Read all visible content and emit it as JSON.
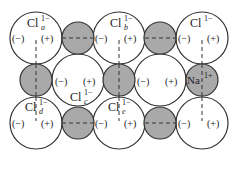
{
  "colors": {
    "large_fill": "#ffffff",
    "small_fill": "#a9a9a9",
    "stroke": "#333333"
  },
  "large_ions": [
    {
      "id": "cl-a",
      "label": "Cl",
      "sup": "1−",
      "sub": "a",
      "cx": 36,
      "cy": 38,
      "r": 26,
      "charges": "(−)-(+)",
      "label_pos": "top"
    },
    {
      "id": "cl-b",
      "label": "Cl",
      "sup": "1−",
      "sub": "b",
      "cx": 119,
      "cy": 38,
      "r": 26,
      "charges": "(−)-(+)",
      "label_pos": "top"
    },
    {
      "id": "cl-top-right",
      "label": "Cl",
      "sup": "1−",
      "sub": "",
      "cx": 202,
      "cy": 38,
      "r": 26,
      "charges": "(−)-(+)",
      "label_pos": "top"
    },
    {
      "id": "cl-c",
      "label": "Cl",
      "sup": "1−",
      "sub": "c",
      "cx": 78,
      "cy": 80,
      "r": 26,
      "charges": "(−) (+)",
      "label_pos": "bottom"
    },
    {
      "id": "cl-mid-right",
      "label": "",
      "sup": "",
      "sub": "",
      "cx": 160,
      "cy": 80,
      "r": 26,
      "charges": "(−) (+)",
      "label_pos": "none"
    },
    {
      "id": "cl-d",
      "label": "Cl",
      "sup": "1−",
      "sub": "d",
      "cx": 36,
      "cy": 123,
      "r": 26,
      "charges": "(−)-(+)",
      "label_pos": "top"
    },
    {
      "id": "cl-e",
      "label": "Cl",
      "sup": "1−",
      "sub": "e",
      "cx": 119,
      "cy": 123,
      "r": 26,
      "charges": "(−)-(+)",
      "label_pos": "top"
    },
    {
      "id": "cl-bottom-right",
      "label": "",
      "sup": "",
      "sub": "",
      "cx": 202,
      "cy": 123,
      "r": 26,
      "charges": "(−)-(+)",
      "label_pos": "none"
    }
  ],
  "small_ions": [
    {
      "id": "na-top-1",
      "cx": 78,
      "cy": 38,
      "r": 16,
      "label": ""
    },
    {
      "id": "na-top-2",
      "cx": 160,
      "cy": 38,
      "r": 16,
      "label": ""
    },
    {
      "id": "na-mid-1",
      "cx": 36,
      "cy": 80,
      "r": 16,
      "label": ""
    },
    {
      "id": "na-mid-2",
      "cx": 119,
      "cy": 80,
      "r": 16,
      "label": ""
    },
    {
      "id": "na-mid-3",
      "cx": 202,
      "cy": 80,
      "r": 16,
      "label": "Na",
      "sup": "1+"
    },
    {
      "id": "na-bot-1",
      "cx": 78,
      "cy": 123,
      "r": 16,
      "label": ""
    },
    {
      "id": "na-bot-2",
      "cx": 160,
      "cy": 123,
      "r": 16,
      "label": ""
    }
  ],
  "text": {
    "neg": "(−)",
    "pos": "(+)",
    "cl": "Cl",
    "cl_charge": "1−",
    "na": "Na",
    "na_charge": "1+",
    "sub_a": "a",
    "sub_b": "b",
    "sub_c": "c",
    "sub_d": "d",
    "sub_e": "e"
  }
}
